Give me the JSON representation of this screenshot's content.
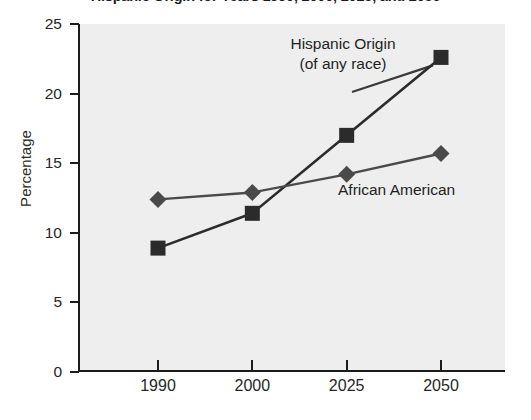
{
  "chart_data": {
    "type": "line",
    "title": "Hispanic Origin for Years 1990, 2000, 2025, and 2050",
    "xlabel": "",
    "ylabel": "Percentage",
    "categories": [
      "1990",
      "2000",
      "2025",
      "2050"
    ],
    "ylim": [
      0,
      25
    ],
    "yticks": [
      0,
      5,
      10,
      15,
      20,
      25
    ],
    "ytick_labels": [
      "0",
      "5",
      "10",
      "15",
      "20",
      "25"
    ],
    "grid": false,
    "legend_position": "inline-annotations",
    "series": [
      {
        "name": "Hispanic Origin (of any race)",
        "marker": "square",
        "color": "#2b2b2b",
        "values": [
          8.9,
          11.4,
          17.0,
          22.6
        ]
      },
      {
        "name": "African American",
        "marker": "diamond",
        "color": "#4a4a4a",
        "values": [
          12.4,
          12.9,
          14.2,
          15.7
        ]
      }
    ],
    "annotations": [
      {
        "text_line1": "Hispanic Origin",
        "text_line2": "(of any race)"
      },
      {
        "text_line1": "African American",
        "text_line2": ""
      }
    ]
  },
  "labels": {
    "hispanic_line1": "Hispanic Origin",
    "hispanic_line2": "(of any race)",
    "african_american": "African American"
  },
  "axis": {
    "y_title": "Percentage"
  },
  "colors": {
    "plot_background": "#eeeeee",
    "axis": "#1c1c1c",
    "hispanic": "#2b2b2b",
    "african_american": "#4a4a4a"
  }
}
